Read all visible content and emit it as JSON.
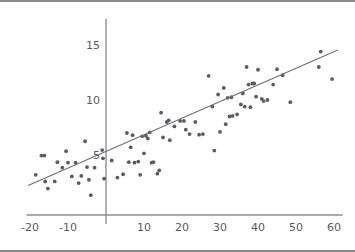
{
  "figure": {
    "name": "scatter-plot-with-regression-line",
    "background_color": "#ffffff",
    "border_color": "#8a8a8a",
    "point_color": "#5b5b66",
    "line_color": "#6e6e78",
    "axis_color": "#8d8d95",
    "label_color": "#5a5a62"
  },
  "chart_data": {
    "type": "scatter",
    "title": "",
    "subtitle": "",
    "xlabel": "",
    "ylabel": "",
    "xlim": [
      -22,
      62
    ],
    "ylim": [
      1,
      16.5
    ],
    "grid": false,
    "legend": null,
    "x_ticks": [
      -20,
      -10,
      10,
      20,
      30,
      40,
      50,
      60
    ],
    "x_tick_labels": [
      "-20",
      "-10",
      "10",
      "20",
      "30",
      "40",
      "50",
      "60"
    ],
    "y_ticks": [
      5,
      10,
      15
    ],
    "y_tick_labels": [
      "5",
      "10",
      "15"
    ],
    "trend_line": {
      "type": "linear-fit",
      "slope": 0.151,
      "intercept": 5.33,
      "x_start": -20.5,
      "x_end": 61,
      "y_start": 2.23,
      "y_end": 14.54
    },
    "points": [
      [
        -18.5,
        3.2
      ],
      [
        -17.0,
        4.95
      ],
      [
        -16.2,
        4.95
      ],
      [
        -16.0,
        2.6
      ],
      [
        -15.3,
        1.95
      ],
      [
        -13.5,
        2.6
      ],
      [
        -12.8,
        4.35
      ],
      [
        -11.5,
        3.85
      ],
      [
        -10.5,
        5.35
      ],
      [
        -10.0,
        4.3
      ],
      [
        -9.0,
        3.05
      ],
      [
        -8.0,
        4.3
      ],
      [
        -7.2,
        2.45
      ],
      [
        -6.5,
        3.1
      ],
      [
        -5.5,
        6.25
      ],
      [
        -5.0,
        3.9
      ],
      [
        -4.5,
        2.75
      ],
      [
        -4.0,
        1.35
      ],
      [
        -3.0,
        3.85
      ],
      [
        -1.0,
        5.45
      ],
      [
        -0.8,
        4.7
      ],
      [
        -0.5,
        2.85
      ],
      [
        1.5,
        4.5
      ],
      [
        3.0,
        2.95
      ],
      [
        4.5,
        3.25
      ],
      [
        5.5,
        7.0
      ],
      [
        6.0,
        4.35
      ],
      [
        6.5,
        5.7
      ],
      [
        7.0,
        6.8
      ],
      [
        7.5,
        4.3
      ],
      [
        8.5,
        4.4
      ],
      [
        9.0,
        3.2
      ],
      [
        9.5,
        6.7
      ],
      [
        10.0,
        5.15
      ],
      [
        10.5,
        6.75
      ],
      [
        11.0,
        6.5
      ],
      [
        11.5,
        7.05
      ],
      [
        12.0,
        4.3
      ],
      [
        12.5,
        4.35
      ],
      [
        13.5,
        3.3
      ],
      [
        14.0,
        3.6
      ],
      [
        14.5,
        8.85
      ],
      [
        15.0,
        6.6
      ],
      [
        16.0,
        8.0
      ],
      [
        16.5,
        8.15
      ],
      [
        16.8,
        6.35
      ],
      [
        18.0,
        7.6
      ],
      [
        19.5,
        8.1
      ],
      [
        20.5,
        8.1
      ],
      [
        21.0,
        7.3
      ],
      [
        22.0,
        6.9
      ],
      [
        23.5,
        8.0
      ],
      [
        24.5,
        6.85
      ],
      [
        25.5,
        6.9
      ],
      [
        27.0,
        12.2
      ],
      [
        28.0,
        9.4
      ],
      [
        28.5,
        5.4
      ],
      [
        29.5,
        10.5
      ],
      [
        30.0,
        7.1
      ],
      [
        31.0,
        11.1
      ],
      [
        31.5,
        7.8
      ],
      [
        32.0,
        10.2
      ],
      [
        32.5,
        8.5
      ],
      [
        33.0,
        10.25
      ],
      [
        33.3,
        8.55
      ],
      [
        34.5,
        8.7
      ],
      [
        35.5,
        9.6
      ],
      [
        36.0,
        10.6
      ],
      [
        36.5,
        9.4
      ],
      [
        37.0,
        13.0
      ],
      [
        37.5,
        11.4
      ],
      [
        38.0,
        9.35
      ],
      [
        38.5,
        11.5
      ],
      [
        39.0,
        11.5
      ],
      [
        39.5,
        10.3
      ],
      [
        40.0,
        12.75
      ],
      [
        41.0,
        10.1
      ],
      [
        41.5,
        9.9
      ],
      [
        42.5,
        10.0
      ],
      [
        44.0,
        11.4
      ],
      [
        45.0,
        12.8
      ],
      [
        46.5,
        12.25
      ],
      [
        48.5,
        9.8
      ],
      [
        56.0,
        13.0
      ],
      [
        56.5,
        14.4
      ],
      [
        59.5,
        11.9
      ]
    ]
  }
}
